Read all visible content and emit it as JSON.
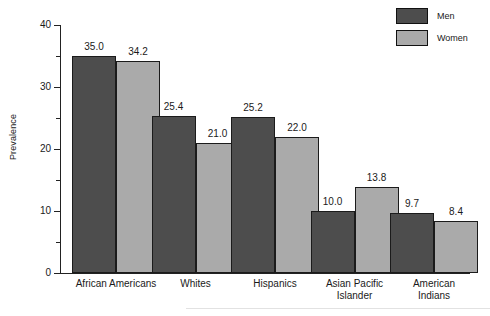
{
  "chart_data": {
    "type": "bar",
    "title": "",
    "subtitle": "",
    "xlabel": "",
    "ylabel": "Prevalence",
    "ylim": [
      0,
      40
    ],
    "y_major_ticks": [
      0,
      10,
      20,
      30,
      40
    ],
    "y_minor_ticks": [
      5,
      15,
      25,
      35
    ],
    "y_tick_labels": [
      "0",
      "10",
      "20",
      "30",
      "40"
    ],
    "grid": false,
    "legend_position": "top-right",
    "categories": [
      "African Americans",
      "Whites",
      "Hispanics",
      "Asian Pacific\nIslander",
      "American Indians"
    ],
    "series": [
      {
        "name": "Men",
        "color": "#4d4d4d",
        "values": [
          35.0,
          25.4,
          25.2,
          10.0,
          9.7
        ],
        "labels": [
          "35.0",
          "25.4",
          "25.2",
          "10.0",
          "9.7"
        ]
      },
      {
        "name": "Women",
        "color": "#aaaaaa",
        "values": [
          34.2,
          21.0,
          22.0,
          13.8,
          8.4
        ],
        "labels": [
          "34.2",
          "21.0",
          "22.0",
          "13.8",
          "8.4"
        ]
      }
    ],
    "annotations": []
  },
  "legend": {
    "items": [
      {
        "label": "Men",
        "color": "#4d4d4d"
      },
      {
        "label": "Women",
        "color": "#aaaaaa"
      }
    ]
  },
  "axis": {
    "y_title": "Prevalence"
  }
}
